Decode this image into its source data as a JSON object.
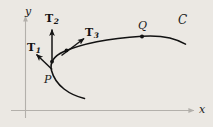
{
  "figure": {
    "background_color": "#ebe8e3",
    "axis_color": "#b3b0ab",
    "curve_color": "#121212",
    "vector_color": "#141414",
    "axes": {
      "x_label": "x",
      "y_label": "y"
    },
    "curve": {
      "name": "C",
      "label": "C"
    },
    "points": [
      {
        "name": "P",
        "label": "P",
        "x": 52,
        "y": 70
      },
      {
        "name": "T2-base",
        "label": "",
        "x": 52,
        "y": 61
      },
      {
        "name": "T3-base",
        "label": "",
        "x": 66,
        "y": 52
      },
      {
        "name": "Q",
        "label": "Q",
        "x": 142,
        "y": 36
      }
    ],
    "vectors": [
      {
        "name": "T1",
        "base": "T1",
        "subscript": "1"
      },
      {
        "name": "T2",
        "base": "T2",
        "subscript": "2"
      },
      {
        "name": "T3",
        "base": "T3",
        "subscript": "3"
      }
    ],
    "vector_labels": {
      "t1_base": "T",
      "t1_sub": "1",
      "t2_base": "T",
      "t2_sub": "2",
      "t3_base": "T",
      "t3_sub": "3"
    }
  }
}
